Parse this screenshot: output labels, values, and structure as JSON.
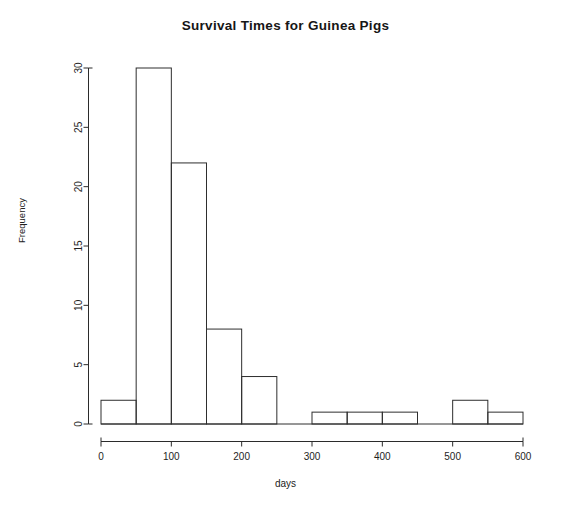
{
  "chart_data": {
    "type": "bar",
    "title": "Survival Times for Guinea Pigs",
    "xlabel": "days",
    "ylabel": "Frequency",
    "bin_width": 50,
    "bin_edges": [
      0,
      50,
      100,
      150,
      200,
      250,
      300,
      350,
      400,
      450,
      500,
      550,
      600
    ],
    "categories": [
      "0-50",
      "50-100",
      "100-150",
      "150-200",
      "200-250",
      "250-300",
      "300-350",
      "350-400",
      "400-450",
      "450-500",
      "500-550",
      "550-600"
    ],
    "values": [
      2,
      30,
      22,
      8,
      4,
      0,
      1,
      1,
      1,
      0,
      2,
      1
    ],
    "xlim": [
      0,
      600
    ],
    "ylim": [
      0,
      30
    ],
    "xticks": [
      0,
      100,
      200,
      300,
      400,
      500,
      600
    ],
    "yticks": [
      0,
      5,
      10,
      15,
      20,
      25,
      30
    ],
    "xtick_labels": [
      "0",
      "100",
      "200",
      "300",
      "400",
      "500",
      "600"
    ],
    "ytick_labels": [
      "0",
      "5",
      "10",
      "15",
      "20",
      "25",
      "30"
    ],
    "grid": false,
    "legend": null,
    "bar_fill": "none",
    "bar_stroke": "#2e2e2e",
    "background": "#ffffff"
  }
}
